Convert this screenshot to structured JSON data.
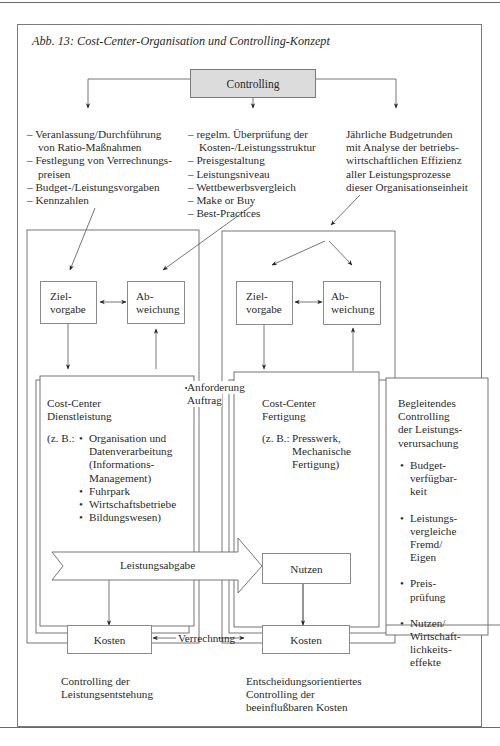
{
  "figure": {
    "title": "Abb. 13: Cost-Center-Organisation und Controlling-Konzept",
    "root_node": "Controlling",
    "left_branch": {
      "items": [
        "Veranlassung/Durchführung",
        "von Ratio-Maßnahmen",
        "Festlegung von Verrechnungs-",
        "preisen",
        "Budget-/Leistungsvorgaben",
        "Kennzahlen"
      ]
    },
    "middle_branch": {
      "items": [
        "regelm. Überprüfung der",
        "Kosten-/Leistungsstruktur",
        "Preisgestaltung",
        "Leistungsniveau",
        "Wettbewerbsvergleich",
        "Make or Buy",
        "Best-Practices"
      ]
    },
    "right_branch": {
      "lines": [
        "Jährliche Budgetrunden",
        "mit Analyse der betriebs-",
        "wirtschaftlichen Effizienz",
        "aller Leistungsprozesse",
        "dieser Organisationseinheit"
      ]
    },
    "left_section": {
      "zielvorgabe": [
        "Ziel-",
        "vorgabe"
      ],
      "abweichung": [
        "Ab-",
        "weichung"
      ],
      "cost_center_title": [
        "Cost-Center",
        "Dienstleistung"
      ],
      "example_prefix": "(z. B.:",
      "examples": [
        [
          "Organisation und",
          "Datenverarbeitung",
          "(Informations-",
          "Management)"
        ],
        [
          "Fuhrpark"
        ],
        [
          "Wirtschaftsbetriebe"
        ],
        [
          "Bildungswesen)"
        ]
      ],
      "leistungsabgabe": "Leistungsabgabe",
      "kosten": "Kosten",
      "caption": [
        "Controlling der",
        "Leistungsentstehung"
      ]
    },
    "right_section": {
      "zielvorgabe": [
        "Ziel-",
        "vorgabe"
      ],
      "abweichung": [
        "Ab-",
        "weichung"
      ],
      "cost_center_title": [
        "Cost-Center",
        "Fertigung"
      ],
      "example_prefix": "(z. B.:",
      "examples": [
        "Presswerk,",
        "Mechanische",
        "Fertigung)"
      ],
      "nutzen": "Nutzen",
      "kosten": "Kosten",
      "caption": [
        "Entscheidungsorientiertes",
        "Controlling der",
        "beeinflußbaren Kosten"
      ]
    },
    "connector_labels": {
      "anforderung": "Anforderung",
      "auftrag": "Auftrag",
      "verrechnung": "Verrechnung"
    },
    "side_panel": {
      "title": [
        "Begleitendes",
        "Controlling",
        "der Leistungs-",
        "verursachung"
      ],
      "bullets": [
        [
          "Budget-",
          "verfügbar-",
          "keit"
        ],
        [
          "Leistungs-",
          "vergleiche",
          "Fremd/",
          "Eigen"
        ],
        [
          "Preis-",
          "prüfung"
        ],
        [
          "Nutzen/",
          "Wirtschaft-",
          "lichkeits-",
          "effekte"
        ]
      ]
    }
  }
}
